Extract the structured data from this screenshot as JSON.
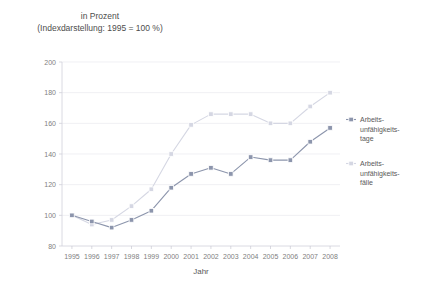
{
  "header": {
    "title_line1": "in Prozent",
    "title_line2": "(Indexdarstellung: 1995 = 100 %)"
  },
  "axis": {
    "x_title": "Jahr",
    "y_ticks": [
      "200",
      "180",
      "160",
      "140",
      "120",
      "100",
      "80"
    ],
    "x_ticks": [
      "1995",
      "1996",
      "1997",
      "1998",
      "1999",
      "2000",
      "2001",
      "2002",
      "2003",
      "2004",
      "2005",
      "2006",
      "2007",
      "2008"
    ]
  },
  "legend": {
    "items": [
      {
        "label_line1": "Arbeits-",
        "label_line2": "unfähigkeits-",
        "label_line3": "tage",
        "color": "#8c95ac"
      },
      {
        "label_line1": "Arbeits-",
        "label_line2": "unfähigkeits-",
        "label_line3": "fälle",
        "color": "#d5d7e3"
      }
    ]
  },
  "colors": {
    "series_tage": "#8c95ac",
    "series_faelle": "#d5d7e3",
    "grid": "#e9e9ef",
    "text": "#595959"
  },
  "chart_data": {
    "type": "line",
    "title": "in Prozent (Indexdarstellung: 1995 = 100 %)",
    "xlabel": "Jahr",
    "ylabel": "",
    "grid": true,
    "legend_position": "right",
    "ylim": [
      80,
      200
    ],
    "ytick_step": 20,
    "categories": [
      "1995",
      "1996",
      "1997",
      "1998",
      "1999",
      "2000",
      "2001",
      "2002",
      "2003",
      "2004",
      "2005",
      "2006",
      "2007",
      "2008"
    ],
    "series": [
      {
        "name": "Arbeitsunfähigkeitstage",
        "color": "#8c95ac",
        "values": [
          100,
          96,
          92,
          97,
          103,
          118,
          127,
          131,
          127,
          138,
          136,
          136,
          148,
          157
        ]
      },
      {
        "name": "Arbeitsunfähigkeitsfälle",
        "color": "#d5d7e3",
        "values": [
          100,
          94,
          97,
          106,
          117,
          140,
          159,
          166,
          166,
          166,
          160,
          160,
          171,
          180
        ]
      }
    ]
  }
}
